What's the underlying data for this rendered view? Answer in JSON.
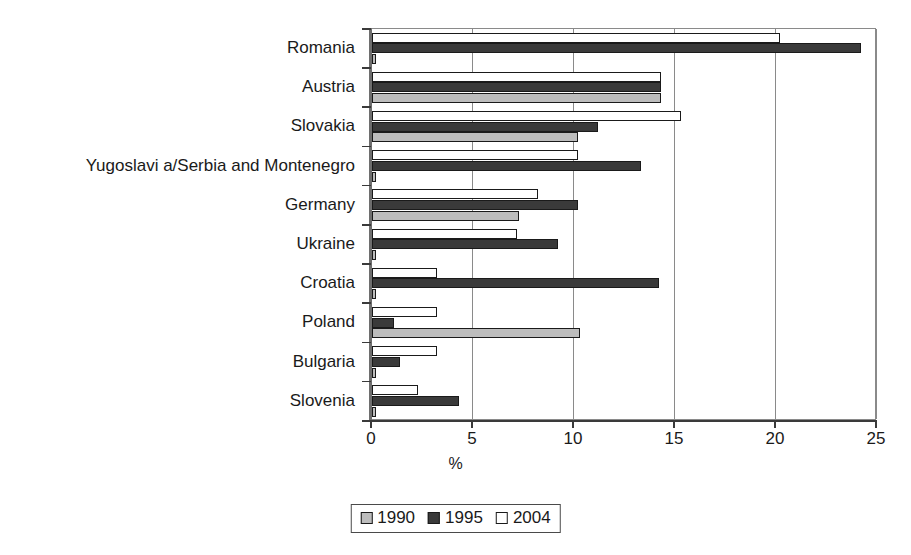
{
  "chart_data": {
    "type": "bar",
    "orientation": "horizontal",
    "title": "",
    "xlabel": "%",
    "ylabel": "",
    "xlim": [
      0,
      25
    ],
    "xticks": [
      "0",
      "5",
      "10",
      "15",
      "20",
      "25"
    ],
    "grid": "vertical",
    "legend_position": "bottom-center",
    "categories": [
      "Romania",
      "Austria",
      "Slovakia",
      "Yugoslavi a/Serbia and Montenegro",
      "Germany",
      "Ukraine",
      "Croatia",
      "Poland",
      "Bulgaria",
      "Slovenia"
    ],
    "series": [
      {
        "name": "1990",
        "color": "#bdbdbd",
        "values": [
          0.2,
          14.3,
          10.2,
          0.2,
          7.3,
          0.2,
          0.2,
          10.3,
          0.2,
          0.2
        ]
      },
      {
        "name": "1995",
        "color": "#3a3a3a",
        "values": [
          24.2,
          14.3,
          11.2,
          13.3,
          10.2,
          9.2,
          14.2,
          1.1,
          1.4,
          4.3
        ]
      },
      {
        "name": "2004",
        "color": "#ffffff",
        "values": [
          20.2,
          14.3,
          15.3,
          10.2,
          8.2,
          7.2,
          3.2,
          3.2,
          3.2,
          2.3
        ]
      }
    ]
  },
  "axis": {
    "x_title": "%",
    "tick_labels": [
      "0",
      "5",
      "10",
      "15",
      "20",
      "25"
    ]
  },
  "legend": {
    "entries": [
      {
        "label": "1990",
        "swatch": "s1990"
      },
      {
        "label": "1995",
        "swatch": "s1995"
      },
      {
        "label": "2004",
        "swatch": "s2004"
      }
    ]
  }
}
